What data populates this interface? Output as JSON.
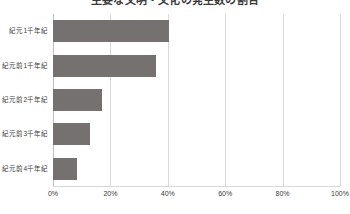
{
  "chart_data": {
    "type": "bar",
    "orientation": "horizontal",
    "title": "主要な文明・文化の発生数の割合",
    "categories": [
      "紀元1千年紀",
      "紀元前1千年紀",
      "紀元前2千年紀",
      "紀元前3千年紀",
      "紀元前4千年紀"
    ],
    "values": [
      40.5,
      36.0,
      17.0,
      13.0,
      8.5
    ],
    "xlabel": "",
    "ylabel": "",
    "xlim": [
      0,
      100
    ],
    "xticks": [
      0,
      20,
      40,
      60,
      80,
      100
    ],
    "xticklabels": [
      "0%",
      "20%",
      "40%",
      "60%",
      "80%",
      "100%"
    ],
    "grid": true,
    "legend": false,
    "bar_color": "#767171",
    "gridline_color": "#d9d9d9",
    "text_color": "#3a3a3a"
  }
}
